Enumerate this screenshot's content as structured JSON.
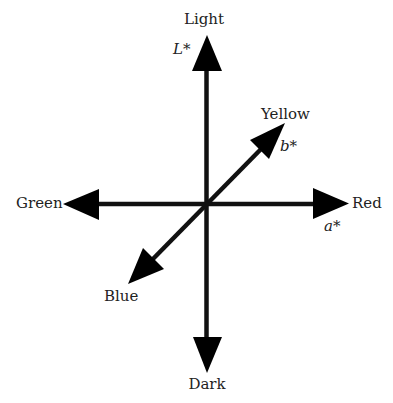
{
  "diagram": {
    "center": {
      "x": 206,
      "y": 204
    },
    "colors": {
      "arrow": "#000000",
      "text": "#222222",
      "background": "#ffffff"
    },
    "axes": [
      {
        "id": "L",
        "axis_label": "L*",
        "positive_end": "Light",
        "negative_end": "Dark"
      },
      {
        "id": "a",
        "axis_label": "a*",
        "positive_end": "Red",
        "negative_end": "Green"
      },
      {
        "id": "b",
        "axis_label": "b*",
        "positive_end": "Yellow",
        "negative_end": "Blue"
      }
    ],
    "labels": {
      "light": "Light",
      "dark": "Dark",
      "red": "Red",
      "green": "Green",
      "yellow": "Yellow",
      "blue": "Blue",
      "l_star": "L*",
      "a_star": "a*",
      "b_star": "b*"
    }
  }
}
